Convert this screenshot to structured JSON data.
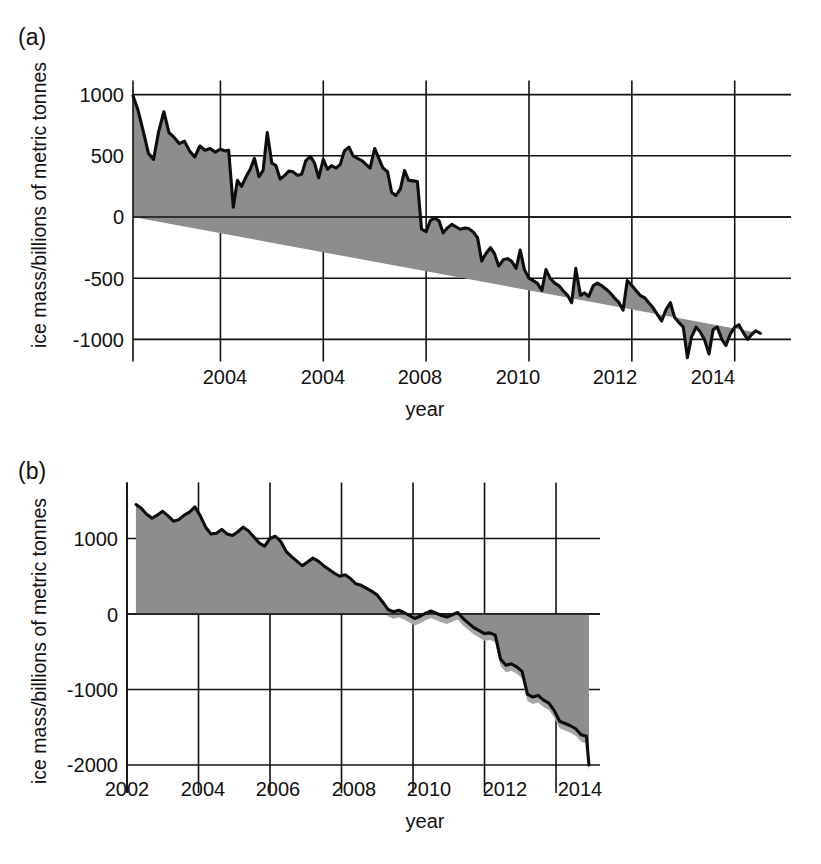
{
  "figure": {
    "ylabel": "ice mass/billions of metric tonnes",
    "xlabel": "year"
  },
  "panels": [
    {
      "tag": "(a)",
      "yticks": [
        "1000",
        "500",
        "0",
        "-500",
        "-1000"
      ],
      "xticks": [
        "2004",
        "2004",
        "2008",
        "2010",
        "2012",
        "2014"
      ]
    },
    {
      "tag": "(b)",
      "yticks": [
        "1000",
        "0",
        "-1000",
        "-2000"
      ],
      "xticks": [
        "2002",
        "2004",
        "2006",
        "2008",
        "2010",
        "2012",
        "2014"
      ]
    }
  ],
  "chart_data": [
    {
      "type": "area",
      "title": "(a)",
      "xlabel": "year",
      "ylabel": "ice mass/billions of metric tonnes",
      "xlim": [
        2002.3,
        2014.9
      ],
      "ylim": [
        -1250,
        1050
      ],
      "yticks": [
        1000,
        500,
        0,
        -500,
        -1000
      ],
      "xticks": [
        2004,
        2006,
        2008,
        2010,
        2012,
        2014
      ],
      "xtick_labels": [
        "2004",
        "2004",
        "2008",
        "2010",
        "2012",
        "2014"
      ],
      "grid": true,
      "legend": "none",
      "fill_color": "#8d8d8d",
      "line_color": "#0d0d0d",
      "series": [
        {
          "name": "Greenland ice mass anomaly",
          "x": [
            2002.3,
            2002.4,
            2002.5,
            2002.6,
            2002.7,
            2002.8,
            2002.9,
            2003.0,
            2003.1,
            2003.2,
            2003.3,
            2003.4,
            2003.5,
            2003.6,
            2003.7,
            2003.8,
            2003.9,
            2004.0,
            2004.08,
            2004.16,
            2004.25,
            2004.33,
            2004.41,
            2004.5,
            2004.58,
            2004.66,
            2004.75,
            2004.83,
            2004.91,
            2005.0,
            2005.08,
            2005.16,
            2005.25,
            2005.33,
            2005.41,
            2005.5,
            2005.58,
            2005.66,
            2005.75,
            2005.83,
            2005.91,
            2006.0,
            2006.08,
            2006.16,
            2006.25,
            2006.33,
            2006.41,
            2006.5,
            2006.58,
            2006.66,
            2006.75,
            2006.83,
            2006.91,
            2007.0,
            2007.08,
            2007.16,
            2007.25,
            2007.33,
            2007.41,
            2007.5,
            2007.58,
            2007.66,
            2007.75,
            2007.83,
            2007.91,
            2008.0,
            2008.08,
            2008.16,
            2008.25,
            2008.33,
            2008.41,
            2008.5,
            2008.58,
            2008.66,
            2008.75,
            2008.83,
            2008.91,
            2009.0,
            2009.08,
            2009.16,
            2009.25,
            2009.33,
            2009.41,
            2009.5,
            2009.58,
            2009.66,
            2009.75,
            2009.83,
            2009.91,
            2010.0,
            2010.08,
            2010.16,
            2010.25,
            2010.33,
            2010.41,
            2010.5,
            2010.58,
            2010.66,
            2010.75,
            2010.83,
            2010.91,
            2011.0,
            2011.08,
            2011.16,
            2011.25,
            2011.33,
            2011.41,
            2011.5,
            2011.58,
            2011.66,
            2011.75,
            2011.83,
            2011.91,
            2012.0,
            2012.08,
            2012.16,
            2012.25,
            2012.33,
            2012.41,
            2012.5,
            2012.58,
            2012.66,
            2012.75,
            2012.83,
            2012.91,
            2013.0,
            2013.08,
            2013.16,
            2013.25,
            2013.33,
            2013.41,
            2013.5,
            2013.58,
            2013.66,
            2013.75,
            2013.83,
            2013.91,
            2014.0,
            2014.08,
            2014.16,
            2014.25,
            2014.33,
            2014.41,
            2014.5,
            2014.58,
            2014.66,
            2014.75,
            2014.85
          ],
          "y": [
            990,
            870,
            700,
            520,
            470,
            700,
            860,
            690,
            650,
            600,
            620,
            540,
            490,
            580,
            545,
            560,
            530,
            555,
            540,
            545,
            80,
            300,
            250,
            330,
            390,
            480,
            330,
            380,
            690,
            440,
            420,
            310,
            340,
            375,
            370,
            340,
            350,
            460,
            495,
            440,
            320,
            470,
            390,
            420,
            400,
            430,
            540,
            570,
            500,
            480,
            460,
            430,
            400,
            560,
            480,
            400,
            370,
            200,
            175,
            230,
            380,
            300,
            295,
            290,
            -100,
            -120,
            -30,
            -10,
            -30,
            -130,
            -90,
            -60,
            -80,
            -100,
            -90,
            -95,
            -120,
            -170,
            -360,
            -300,
            -250,
            -300,
            -400,
            -350,
            -340,
            -360,
            -420,
            -270,
            -430,
            -500,
            -520,
            -540,
            -600,
            -430,
            -500,
            -540,
            -560,
            -600,
            -640,
            -700,
            -420,
            -640,
            -620,
            -650,
            -560,
            -540,
            -560,
            -590,
            -620,
            -660,
            -700,
            -760,
            -520,
            -560,
            -600,
            -640,
            -660,
            -700,
            -740,
            -800,
            -850,
            -760,
            -700,
            -820,
            -860,
            -900,
            -1150,
            -980,
            -900,
            -940,
            -1000,
            -1120,
            -920,
            -900,
            -1000,
            -1050,
            -960,
            -900,
            -880,
            -940,
            -1000,
            -960,
            -930,
            -950
          ]
        }
      ]
    },
    {
      "type": "area",
      "title": "(b)",
      "xlabel": "year",
      "ylabel": "ice mass/billions of metric tonnes",
      "xlim": [
        2002.0,
        2014.95
      ],
      "ylim": [
        -2200,
        1600
      ],
      "yticks": [
        1000,
        0,
        -1000,
        -2000
      ],
      "xticks": [
        2002,
        2004,
        2006,
        2008,
        2010,
        2012,
        2014
      ],
      "xtick_labels": [
        "2002",
        "2004",
        "2006",
        "2008",
        "2010",
        "2012",
        "2014"
      ],
      "grid": true,
      "legend": "none",
      "fill_color": "#8d8d8d",
      "band_color": "#a6a6a6",
      "line_color": "#0d0d0d",
      "band_offset": -110,
      "series": [
        {
          "name": "Antarctic ice mass anomaly",
          "x": [
            2002.25,
            2002.4,
            2002.55,
            2002.7,
            2002.85,
            2003.0,
            2003.15,
            2003.3,
            2003.45,
            2003.6,
            2003.75,
            2003.9,
            2004.05,
            2004.2,
            2004.35,
            2004.5,
            2004.65,
            2004.8,
            2004.95,
            2005.1,
            2005.25,
            2005.4,
            2005.55,
            2005.7,
            2005.85,
            2006.0,
            2006.15,
            2006.3,
            2006.45,
            2006.6,
            2006.75,
            2006.9,
            2007.05,
            2007.2,
            2007.35,
            2007.5,
            2007.65,
            2007.8,
            2007.95,
            2008.1,
            2008.25,
            2008.4,
            2008.55,
            2008.7,
            2008.85,
            2009.0,
            2009.15,
            2009.3,
            2009.45,
            2009.6,
            2009.75,
            2009.9,
            2010.05,
            2010.2,
            2010.35,
            2010.5,
            2010.65,
            2010.8,
            2010.95,
            2011.1,
            2011.25,
            2011.4,
            2011.55,
            2011.7,
            2011.85,
            2012.0,
            2012.15,
            2012.3,
            2012.45,
            2012.6,
            2012.75,
            2012.9,
            2013.05,
            2013.2,
            2013.35,
            2013.5,
            2013.65,
            2013.8,
            2013.95,
            2014.1,
            2014.25,
            2014.4,
            2014.55,
            2014.7,
            2014.85,
            2014.92
          ],
          "y": [
            1450,
            1400,
            1320,
            1270,
            1310,
            1360,
            1300,
            1230,
            1250,
            1310,
            1350,
            1420,
            1300,
            1150,
            1060,
            1070,
            1120,
            1060,
            1040,
            1090,
            1150,
            1100,
            1020,
            940,
            900,
            1000,
            1030,
            960,
            830,
            760,
            700,
            640,
            690,
            740,
            700,
            640,
            590,
            540,
            500,
            520,
            470,
            400,
            380,
            340,
            300,
            250,
            160,
            60,
            30,
            50,
            20,
            -20,
            -60,
            -30,
            10,
            40,
            10,
            -20,
            -40,
            -10,
            20,
            -60,
            -120,
            -180,
            -220,
            -260,
            -250,
            -280,
            -600,
            -680,
            -660,
            -700,
            -760,
            -1060,
            -1100,
            -1080,
            -1140,
            -1180,
            -1280,
            -1420,
            -1450,
            -1480,
            -1520,
            -1600,
            -1620,
            -2000
          ]
        }
      ]
    }
  ]
}
